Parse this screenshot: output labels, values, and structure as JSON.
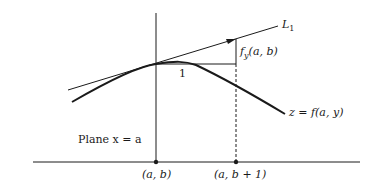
{
  "diagram": {
    "type": "partial-derivative-geometric-interpretation",
    "labels": {
      "tangent_line": "L",
      "tangent_line_subscript": "1",
      "slope": "f",
      "slope_subscript": "y",
      "slope_args": "(a, b)",
      "unit_run": "1",
      "curve": "z = f(a, y)",
      "plane": "Plane x = a",
      "point_origin": "(a, b)",
      "point_shifted": "(a, b + 1)"
    },
    "colors": {
      "stroke": "#1a1a1a",
      "background": "#ffffff"
    }
  }
}
